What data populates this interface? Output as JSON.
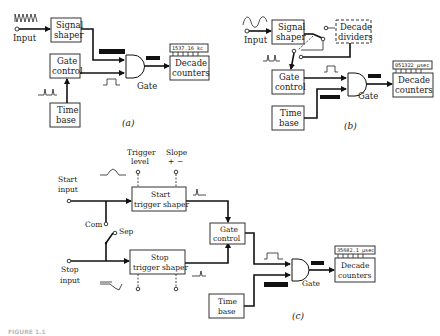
{
  "diagram_a": {
    "caption": "(a)",
    "input_label": "Input",
    "signal_shaper": [
      "Signal",
      "shaper"
    ],
    "gate_control": [
      "Gate",
      "control"
    ],
    "time_base": [
      "Time",
      "base"
    ],
    "gate_label": "Gate",
    "decade_counters": [
      "Decade",
      "counters"
    ],
    "display_reading": "1537.16 kc"
  },
  "diagram_b": {
    "caption": "(b)",
    "input_label": "Input",
    "signal_shaper": [
      "Signal",
      "shaper"
    ],
    "decade_dividers": [
      "Decade",
      "dividers"
    ],
    "gate_control": [
      "Gate",
      "control"
    ],
    "time_base": [
      "Time",
      "base"
    ],
    "gate_label": "Gate",
    "decade_counters": [
      "Decade",
      "counters"
    ],
    "display_reading": "051322 µsec"
  },
  "diagram_c": {
    "caption": "(c)",
    "trigger_level": [
      "Trigger",
      "level"
    ],
    "slope": "Slope",
    "slope_plus": "+",
    "slope_minus": "−",
    "start_input": [
      "Start",
      "input"
    ],
    "stop_input": [
      "Stop",
      "input"
    ],
    "com_label": "Com",
    "sep_label": "Sep",
    "start_trigger_shaper": [
      "Start",
      "trigger shaper"
    ],
    "stop_trigger_shaper": [
      "Stop",
      "trigger shaper"
    ],
    "gate_control": [
      "Gate",
      "control"
    ],
    "time_base": [
      "Time",
      "base"
    ],
    "gate_label": "Gate",
    "decade_counters": [
      "Decade",
      "counters"
    ],
    "display_reading": "35682.1 µsec"
  },
  "figure_caption": "FIGURE 1.1"
}
